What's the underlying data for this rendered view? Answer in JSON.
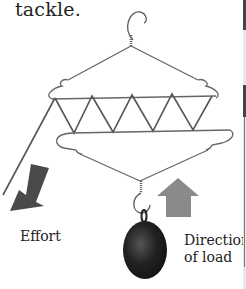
{
  "caption": "tackle.",
  "labels": {
    "effort": "Effort",
    "direction_line1": "Direction",
    "direction_line2": "of load"
  },
  "colors": {
    "wire": "#666666",
    "effort_arrow": "#4a4a4a",
    "load_arrow": "#8a8a8a",
    "weight": "#1a1a1a"
  },
  "icons": {
    "effort_arrow": "arrow-down-left",
    "load_arrow": "arrow-up"
  }
}
